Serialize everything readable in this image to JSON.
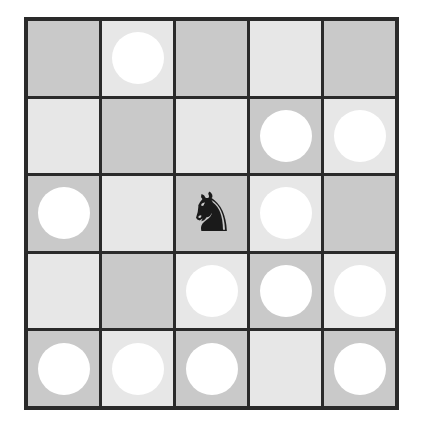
{
  "board": {
    "rows": 5,
    "cols": 5,
    "colors": {
      "dark": "#c9c9c9",
      "light": "#e7e7e7",
      "circle": "#ffffff",
      "piece": "#1a1a1a",
      "border": "#2a2a2a"
    },
    "cells": [
      [
        "dark:empty",
        "light:circle",
        "dark:empty",
        "light:empty",
        "dark:empty"
      ],
      [
        "light:empty",
        "dark:empty",
        "light:empty",
        "dark:circle",
        "light:circle"
      ],
      [
        "dark:circle",
        "light:empty",
        "dark:knight",
        "light:circle",
        "dark:empty"
      ],
      [
        "light:empty",
        "dark:empty",
        "light:circle",
        "dark:circle",
        "light:circle"
      ],
      [
        "dark:circle",
        "light:circle",
        "dark:circle",
        "light:empty",
        "dark:circle"
      ]
    ]
  },
  "pieces": {
    "knight": {
      "glyph": "♞",
      "color": "black",
      "row": 2,
      "col": 2
    }
  }
}
